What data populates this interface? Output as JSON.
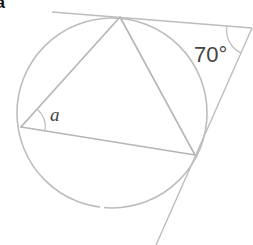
{
  "figure": {
    "corner_label": "a",
    "angle_label_inscribed": "a",
    "angle_label_tangents": "70°",
    "stroke_color": "#b8b8b8",
    "text_color": "#444444"
  },
  "geometry": {
    "circle": {
      "cx": 112,
      "cy": 113,
      "r": 95
    },
    "triangle": [
      [
        120,
        17
      ],
      [
        21,
        127
      ],
      [
        195,
        155
      ]
    ],
    "tangent_intersection": [
      252,
      28
    ],
    "tangent_top_start": [
      52,
      12
    ],
    "tangent_bottom_end": [
      156,
      245
    ]
  }
}
